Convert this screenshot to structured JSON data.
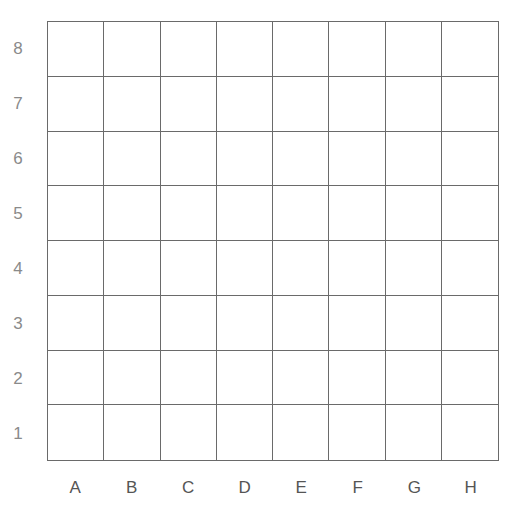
{
  "board": {
    "rows": 8,
    "cols": 8,
    "row_labels": [
      "8",
      "7",
      "6",
      "5",
      "4",
      "3",
      "2",
      "1"
    ],
    "col_labels": [
      "A",
      "B",
      "C",
      "D",
      "E",
      "F",
      "G",
      "H"
    ],
    "line_color": "#6a6a6a",
    "cell_color": "#ffffff"
  }
}
